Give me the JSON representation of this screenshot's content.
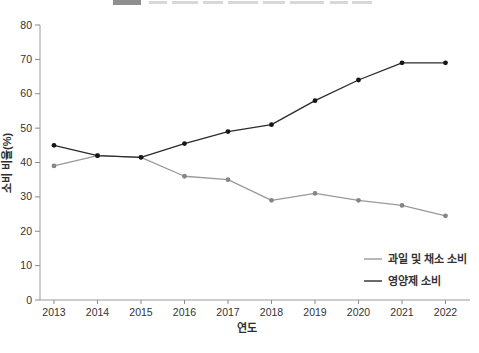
{
  "axes": {
    "xlabel": "연도",
    "ylabel": "소비 비율(%)"
  },
  "legend": {
    "position": "lower-right",
    "items": [
      {
        "label": "과일 및 채소 소비",
        "color": "#9a9a9a"
      },
      {
        "label": "영양제 소비",
        "color": "#2b2b2b"
      }
    ]
  },
  "chart_data": {
    "type": "line",
    "x": [
      2013,
      2014,
      2015,
      2016,
      2017,
      2018,
      2019,
      2020,
      2021,
      2022
    ],
    "series": [
      {
        "name": "과일 및 채소 소비",
        "color": "#9a9a9a",
        "marker_color": "#868686",
        "values": [
          39,
          42,
          41.5,
          36,
          35,
          29,
          31,
          29,
          27.5,
          24.5
        ]
      },
      {
        "name": "영양제 소비",
        "color": "#2b2b2b",
        "marker_color": "#161616",
        "values": [
          45,
          42,
          41.5,
          45.5,
          49,
          51,
          58,
          64,
          69,
          69
        ]
      }
    ],
    "xlabel": "연도",
    "ylabel": "소비 비율(%)",
    "ylim": [
      0,
      80
    ],
    "yticks": [
      0,
      10,
      20,
      30,
      40,
      50,
      60,
      70,
      80
    ],
    "grid": false,
    "legend_position": "lower right",
    "styles": {
      "spine_color": "#9a9a9a",
      "tick_color": "#8a8a8a",
      "tick_label_color": "#333333",
      "axis_label_color": "#2e2e2e",
      "legend_text_color": "#333333"
    }
  }
}
